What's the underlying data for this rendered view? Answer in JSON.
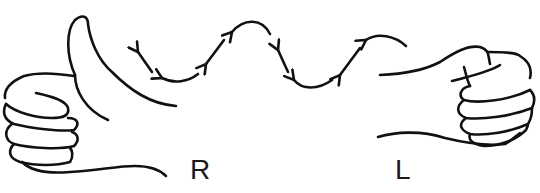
{
  "diagram": {
    "labels": {
      "right_hand": "R",
      "left_hand": "L"
    },
    "elements": {
      "right_hand": "thumbs-up hand",
      "left_hand": "closed fist",
      "arrow_chain": "sequence of curved arrows from left fist toward right hand thumb"
    },
    "colors": {
      "line": "#111111",
      "background": "#ffffff"
    }
  }
}
